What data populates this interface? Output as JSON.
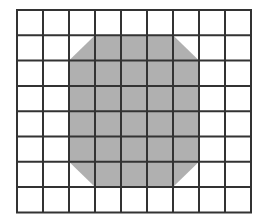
{
  "title": "Shaded octagon on a grid",
  "grid": {
    "columns": 9,
    "rows": 8,
    "origin_x": 17,
    "origin_y": 10,
    "cell_width": 26,
    "cell_height": 25.3,
    "line_color": "#333333",
    "line_width": 2,
    "background": "#ffffff"
  },
  "shape": {
    "name": "octagon",
    "fill": "#b0b0b0",
    "col_start": 2,
    "col_end": 7,
    "row_start": 1,
    "row_end": 7,
    "corner_cut_cells": 1,
    "vertices_in_cells": [
      [
        3,
        1
      ],
      [
        6,
        1
      ],
      [
        7,
        2
      ],
      [
        7,
        6
      ],
      [
        6,
        7
      ],
      [
        3,
        7
      ],
      [
        2,
        6
      ],
      [
        2,
        2
      ]
    ]
  }
}
